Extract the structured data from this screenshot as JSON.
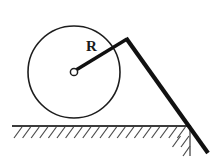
{
  "figure": {
    "canvas": {
      "width": 219,
      "height": 168,
      "background": "#ffffff"
    },
    "labels": {
      "radius_label": "R",
      "radius_label_x": 86,
      "radius_label_y": 39,
      "radius_label_size": 15,
      "radius_label_color": "#1a1a1a"
    },
    "circle": {
      "center_x": 74,
      "center_y": 72,
      "radius": 46,
      "stroke": "#1d1d1d",
      "stroke_width": 1.6,
      "fill": "none"
    },
    "center_marker": {
      "center_x": 74,
      "center_y": 72,
      "radius": 3.6,
      "stroke": "#1d1d1d",
      "stroke_width": 1.5,
      "fill": "#ffffff"
    },
    "radius_line": {
      "x1": 76,
      "y1": 70,
      "x2": 127,
      "y2": 39,
      "stroke": "#111111",
      "stroke_width": 3.4
    },
    "tangent_line": {
      "x1": 126,
      "y1": 38,
      "x2": 208,
      "y2": 153,
      "stroke": "#111111",
      "stroke_width": 4.2
    },
    "ground_line": {
      "x1": 12,
      "y1": 126,
      "x2": 191,
      "y2": 126,
      "stroke": "#3c3c3c",
      "stroke_width": 2.2
    },
    "ground_post": {
      "x1": 190,
      "y1": 126,
      "x2": 190,
      "y2": 156,
      "stroke": "#555555",
      "stroke_width": 1.4
    },
    "hatching": {
      "count": 21,
      "start_x": 14,
      "spacing": 8.6,
      "top_y": 127,
      "height": 11,
      "dx": 8,
      "stroke": "#4a4a4a",
      "stroke_width": 1.2
    }
  }
}
